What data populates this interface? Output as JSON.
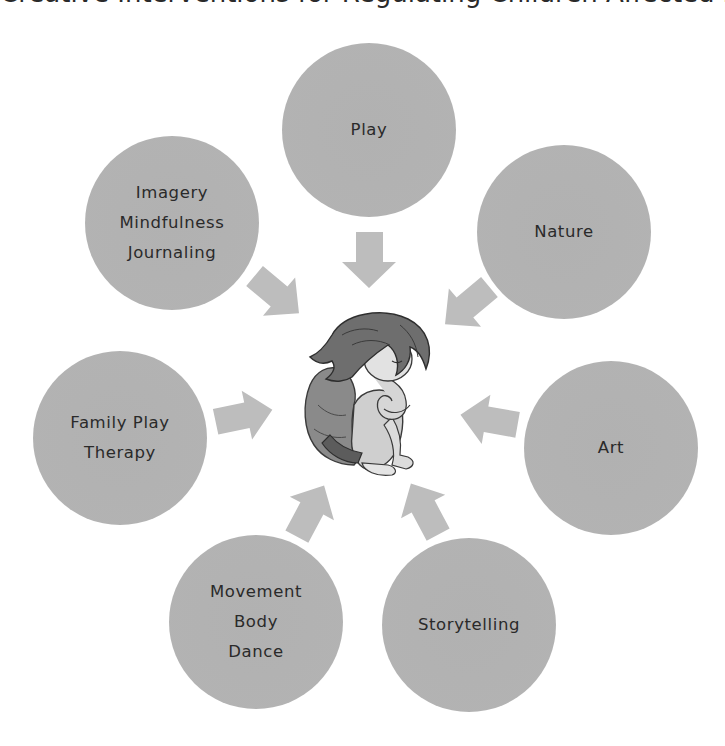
{
  "diagram": {
    "title_partial": "Creative Interventions for Regulating Children Affected by Complex Trauma",
    "center": {
      "label": "Child (crouching, hugging knees)",
      "icon": "child-figure"
    },
    "nodes": [
      {
        "id": "play",
        "lines": [
          "Play"
        ]
      },
      {
        "id": "nature",
        "lines": [
          "Nature"
        ]
      },
      {
        "id": "art",
        "lines": [
          "Art"
        ]
      },
      {
        "id": "storytelling",
        "lines": [
          "Storytelling"
        ]
      },
      {
        "id": "movement",
        "lines": [
          "Movement",
          "Body",
          "Dance"
        ]
      },
      {
        "id": "family-play-therapy",
        "lines": [
          "Family Play",
          "Therapy"
        ]
      },
      {
        "id": "imagery",
        "lines": [
          "Imagery",
          "Mindfulness",
          "Journaling"
        ]
      }
    ],
    "colors": {
      "node_fill": "#b3b3b3",
      "node_ring": "#dadada",
      "arrow": "#bdbdbd",
      "text": "#2a2a2a",
      "background": "#ffffff"
    }
  }
}
